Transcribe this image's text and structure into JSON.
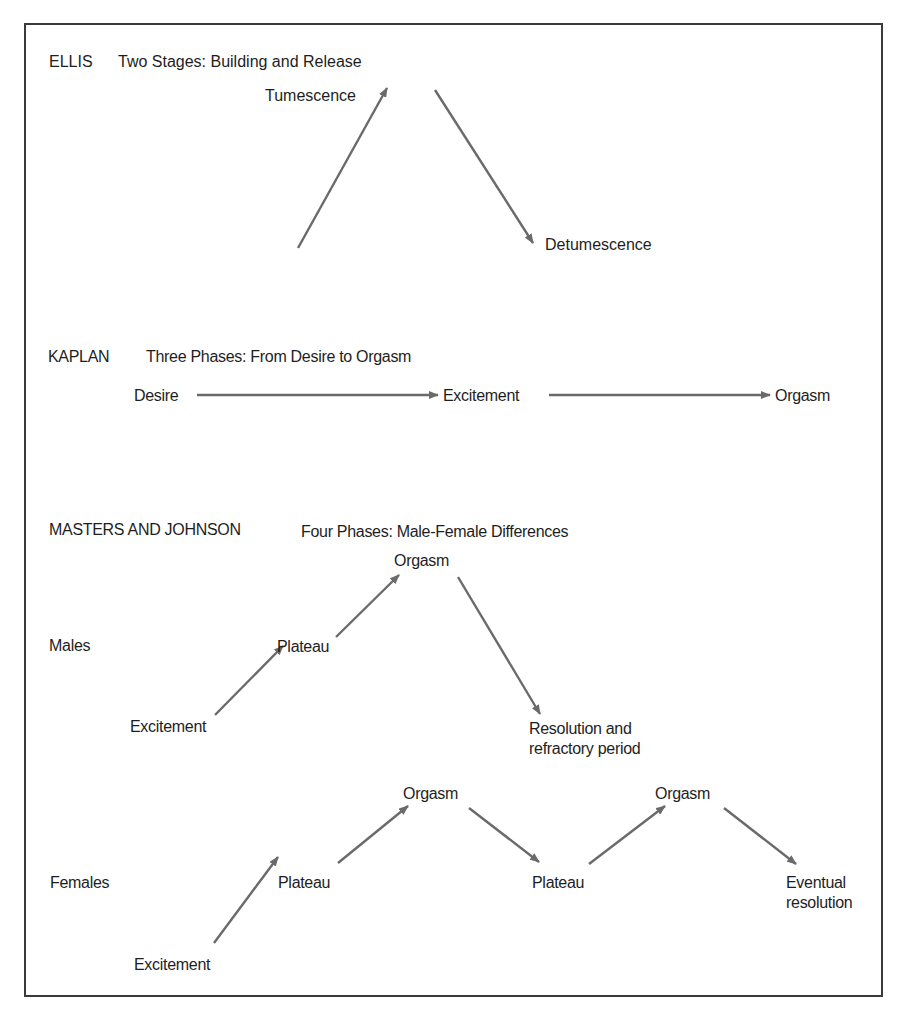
{
  "ellis": {
    "author": "ELLIS",
    "title": "Two Stages: Building and Release",
    "stages": {
      "tumescence": "Tumescence",
      "detumescence": "Detumescence"
    }
  },
  "kaplan": {
    "author": "KAPLAN",
    "title": "Three Phases: From Desire to Orgasm",
    "phases": {
      "desire": "Desire",
      "excitement": "Excitement",
      "orgasm": "Orgasm"
    }
  },
  "masters_johnson": {
    "author": "MASTERS AND JOHNSON",
    "title": "Four Phases: Male-Female Differences",
    "males": {
      "label": "Males",
      "excitement": "Excitement",
      "plateau": "Plateau",
      "orgasm": "Orgasm",
      "resolution_line1": "Resolution and",
      "resolution_line2": "refractory period"
    },
    "females": {
      "label": "Females",
      "excitement": "Excitement",
      "plateau_1": "Plateau",
      "orgasm_1": "Orgasm",
      "plateau_2": "Plateau",
      "orgasm_2": "Orgasm",
      "resolution_line1": "Eventual",
      "resolution_line2": "resolution"
    }
  },
  "colors": {
    "arrow": "#6a6a6a",
    "text": "#1e1e1e",
    "frame": "#3a3a3a"
  }
}
